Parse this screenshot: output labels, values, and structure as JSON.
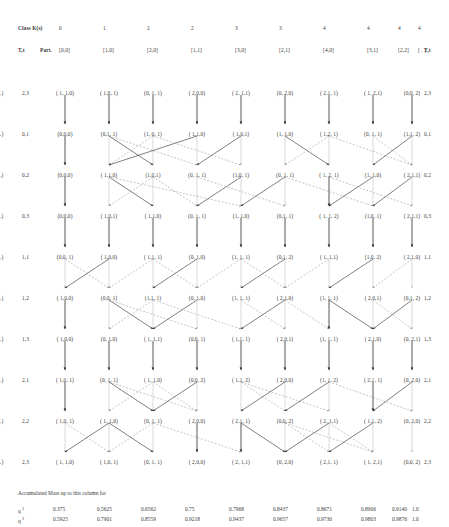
{
  "header": {
    "class_label": "Class K(s)",
    "class_values": [
      "0",
      "1",
      "2",
      "2",
      "3",
      "3",
      "4",
      "4",
      "4",
      "4"
    ],
    "tk_left_label": "T,t",
    "part_label": "Part.",
    "partitions": [
      "[0,0]",
      "[1,0]",
      "[2,0]",
      "[1,1]",
      "[3,0]",
      "[2,1]",
      "[4,0]",
      "[3,1]",
      "[2,2]",
      "[ . ]"
    ],
    "tk_right_label": "T,t"
  },
  "rows": [
    {
      "left_label": "2,3",
      "right_label": "2,3",
      "cells": [
        "( 1, 1,0)",
        "( 1,0, 1)",
        "(0, 1, 1)",
        "( 2,0,0)",
        "( 2, 1,1)",
        "(0, 2,0)",
        "( 2,1, 1)",
        "( 1, 2,1)",
        "(0,0, 2)",
        "(..)"
      ]
    },
    {
      "left_label": "0,1",
      "right_label": "0,1",
      "cells": [
        "(0,0,0)",
        "(0,1, 1)",
        "(1, 0, 1)",
        "( 1,1,0)",
        "( 1,0,1)",
        "(1, 1,0)",
        "( 1,2, 1)",
        "(0, 1, 1)",
        "(1,1, 2)",
        "(..)"
      ]
    },
    {
      "left_label": "0,2",
      "right_label": "0,2",
      "cells": [
        "(0,0,0)",
        "( 1,1,0)",
        "(1,0,1)",
        "(0, 1, 1)",
        "(1,0, 1)",
        "(0, 1, 1)",
        "( 1, 2, 1)",
        "(1, 1,0)",
        "( 2,1,1)",
        "(..)"
      ]
    },
    {
      "left_label": "0,3",
      "right_label": "0,3",
      "cells": [
        "(0,0,0)",
        "( 1,0,1)",
        "( 1,1,0)",
        "(0, 1, 1)",
        "(1, 1,0)",
        "(0,1, 1)",
        "( 1, 1, 2)",
        "(1,0, 1)",
        "( 2,1,1)",
        "(..)"
      ]
    },
    {
      "left_label": "1,1",
      "right_label": "1,1",
      "cells": [
        "(0,0, 1)",
        "( 1,0,0)",
        "( 1,1, 1)",
        "(0, 1,0)",
        "(1, 1, 1)",
        "(0,1, 2)",
        "( 1, 1,1)",
        "(1,0, 2)",
        "( 2,1,0)",
        "(..)"
      ]
    },
    {
      "left_label": "1,2",
      "right_label": "1,2",
      "cells": [
        "( 1,0,0)",
        "(0,0, 1)",
        "(1,1, 1)",
        "(0, 1,0)",
        "(1, 1, 1)",
        "( 2,1,0)",
        "(1, 1, 1)",
        "( 2,0,1)",
        "(0,1, 2)",
        "(..)"
      ]
    },
    {
      "left_label": "1,3",
      "right_label": "1,3",
      "cells": [
        "( 1,0,0)",
        "(0, 1,0)",
        "( 1, 1,1)",
        "(0,0, 1)",
        "( 1,1, 1)",
        "( 2,0,1)",
        "(1, 1, 1)",
        "( 2,1,0)",
        "(0, 2,1)",
        "(..)"
      ]
    },
    {
      "left_label": "2,1",
      "right_label": "2,1",
      "cells": [
        "( 1,0, 1)",
        "(0, 1, 1)",
        "( 1, 1,0)",
        "(0,0, 2)",
        "( 1,1, 2)",
        "( 2,0,0)",
        "(1, 1, 2)",
        "( 2,1, 1)",
        "(0, 2,0)",
        "(..)"
      ]
    },
    {
      "left_label": "2,2",
      "right_label": "2,2",
      "cells": [
        "( 1,0, 1)",
        "( 1, 1,0)",
        "(0, 1, 1)",
        "( 2,0,0)",
        "( 2,1, 1)",
        "(0,0, 2)",
        "( 2, 1,1)",
        "( 1,1, 2)",
        "(0, 2,0)",
        "(..)"
      ]
    },
    {
      "left_label": "2,3",
      "right_label": "2,3",
      "cells": [
        "( 1, 1,0)",
        "( 1,0, 1)",
        "(0, 1, 1)",
        "( 2,0,0)",
        "( 2, 1,1)",
        "(0, 2,0)",
        "( 2,1, 1)",
        "( 1, 2,1)",
        "(0,0, 2)",
        "(..)"
      ]
    }
  ],
  "mass": {
    "caption": "Accumulated Mass up to this column for",
    "series": [
      {
        "label": "q",
        "exponent": "2",
        "values": [
          "0.375",
          "0.5625",
          "0.6562",
          "0.75",
          "0.7968",
          "0.8437",
          "0.8671",
          "0.8906",
          "0.9140",
          "1.0"
        ]
      },
      {
        "label": "q",
        "exponent": "3",
        "values": [
          "0.5925",
          "0.7901",
          "0.8559",
          "0.9218",
          "0.9437",
          "0.9657",
          "0.9730",
          "0.9803",
          "0.9876",
          "1.0"
        ]
      }
    ]
  },
  "style": {
    "solid_arrow_color": "#3a3a3a",
    "dashed_arrow_color": "#8c8c8c",
    "vertical_arrow_color": "#2b2b2b",
    "text_color": "#3a3a3a"
  }
}
